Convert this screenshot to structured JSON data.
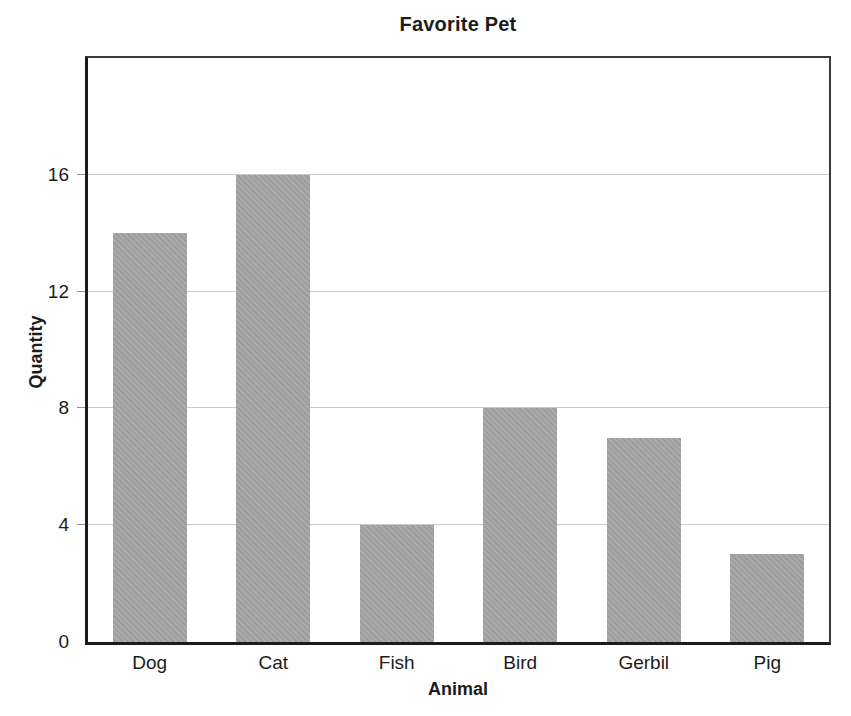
{
  "chart_data": {
    "type": "bar",
    "title": "Favorite Pet",
    "xlabel": "Animal",
    "ylabel": "Quantity",
    "categories": [
      "Dog",
      "Cat",
      "Fish",
      "Bird",
      "Gerbil",
      "Pig"
    ],
    "values": [
      14,
      16,
      4,
      8,
      7,
      3
    ],
    "ylim": [
      0,
      20
    ],
    "yticks": [
      0,
      4,
      8,
      12,
      16
    ],
    "grid": true,
    "legend": false,
    "bar_color": "#a5a5a5",
    "gridline_color": "#c9c9c9",
    "axis_color": "#1b1b1b"
  }
}
